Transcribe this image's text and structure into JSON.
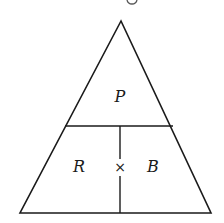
{
  "diagram": {
    "type": "formula-triangle",
    "colors": {
      "stroke": "#1a1a1a",
      "background": "#ffffff"
    },
    "geometry": {
      "apex": [
        121,
        21
      ],
      "base_left": [
        20,
        213
      ],
      "base_right": [
        211,
        213
      ],
      "divider_y": 126,
      "vertical_divider_x": 120
    },
    "labels": {
      "top": "P",
      "bottom_left": "R",
      "operator": "×",
      "bottom_right": "B"
    }
  }
}
